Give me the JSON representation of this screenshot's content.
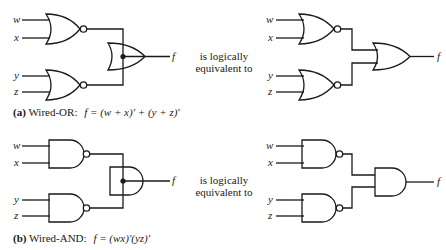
{
  "diagram": {
    "equivalence_text_line1": "is logically",
    "equivalence_text_line2": "equivalent to",
    "part_a": {
      "tag": "(a)",
      "title": "Wired-OR:",
      "formula": "f = (w + x)' + (y + z)'",
      "inputs": [
        "w",
        "x",
        "y",
        "z"
      ],
      "output": "f",
      "left_gates": [
        "NOR",
        "NOR",
        "wired-OR"
      ],
      "right_gates": [
        "NOR",
        "NOR",
        "OR"
      ]
    },
    "part_b": {
      "tag": "(b)",
      "title": "Wired-AND:",
      "formula": "f = (wx)'(yz)'",
      "inputs": [
        "w",
        "x",
        "y",
        "z"
      ],
      "output": "f",
      "left_gates": [
        "NAND",
        "NAND",
        "wired-AND"
      ],
      "right_gates": [
        "NAND",
        "NAND",
        "AND"
      ]
    },
    "colors": {
      "line": "#1a1a1a",
      "background": "#ffffff"
    }
  }
}
